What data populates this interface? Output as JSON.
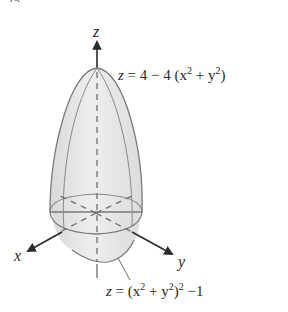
{
  "figure": {
    "top_fragment": "15.",
    "axes": {
      "z_label": "z",
      "x_label": "x",
      "y_label": "y"
    },
    "surfaces": {
      "upper": {
        "equation_display": "z = 4 − 4 (x² + y²)",
        "equation_parts": {
          "lhs": "z",
          "eq": "=",
          "rhs": "4 − 4 (x",
          "sup1": "2",
          "mid": " + y",
          "sup2": "2",
          "end": ")"
        }
      },
      "lower": {
        "equation_display": "z = (x² + y²)² −1",
        "equation_parts": {
          "lhs": "z",
          "eq": "=",
          "rhs": "(x",
          "sup1": "2",
          "mid": " + y",
          "sup2": "2",
          "close": ")",
          "sup3": "2",
          "end": " −1"
        }
      }
    },
    "colors": {
      "surface_fill": "#e6e6e6",
      "surface_stroke": "#7a7a7a",
      "axis": "#2a2a2a",
      "dashed": "#6e6e6e",
      "text": "#2a2a2a"
    }
  }
}
